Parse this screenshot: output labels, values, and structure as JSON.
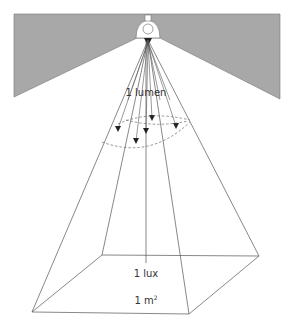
{
  "diagram": {
    "labels": {
      "flux": "1 lumen",
      "illuminance": "1 lux",
      "area_base": "1 m",
      "area_exp": "2"
    },
    "icons": {
      "lamp": "lamp-icon",
      "ceiling": "ceiling-shape"
    },
    "colors": {
      "ceiling_fill": "#a8a8a8",
      "line": "#555555",
      "arrow": "#222222",
      "dashed": "#666666"
    }
  }
}
